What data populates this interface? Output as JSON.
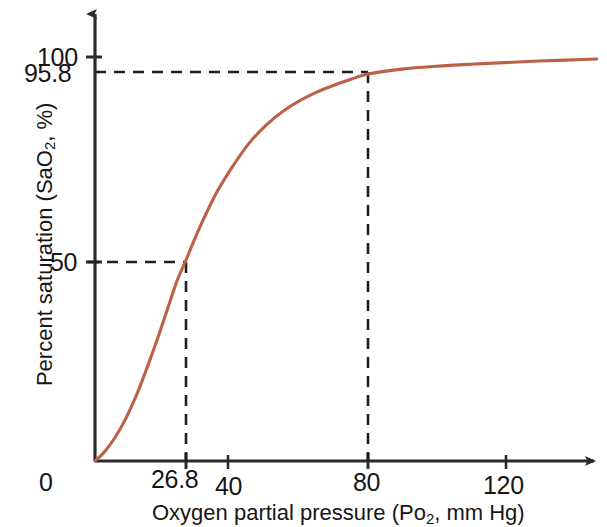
{
  "chart_data": {
    "type": "line",
    "title": "",
    "subtitle": "",
    "xlabel": "Oxygen partial pressure (Po2, mm Hg)",
    "ylabel": "Percent saturation (SaO2, %)",
    "xlabel_parts": {
      "pre": "Oxygen partial pressure (Po",
      "sub": "2",
      "post": ", mm Hg)"
    },
    "ylabel_parts": {
      "pre": "Percent saturation  (SaO",
      "sub": "2",
      "post": ", %)"
    },
    "xlim": [
      0,
      147
    ],
    "ylim": [
      0,
      105
    ],
    "grid": false,
    "legend": null,
    "x_ticks": [
      "0",
      "26.8",
      "40",
      "80",
      "120"
    ],
    "x_tick_values": [
      0,
      26.8,
      40,
      80,
      120
    ],
    "y_ticks": [
      "100",
      "95.8",
      "50"
    ],
    "y_tick_values": [
      100,
      95.8,
      50
    ],
    "series": [
      {
        "name": "Oxygen-hemoglobin dissociation curve",
        "color": "#bb6147",
        "x": [
          0,
          3,
          6,
          9,
          12,
          15,
          18,
          21,
          24,
          26.8,
          30,
          33,
          36,
          40,
          45,
          50,
          55,
          60,
          65,
          70,
          75,
          80,
          90,
          100,
          110,
          120,
          130,
          140,
          147
        ],
        "y": [
          0,
          2.5,
          6,
          10.5,
          16,
          22.5,
          29.5,
          37,
          44.5,
          50,
          56.5,
          62,
          67,
          72.5,
          78.5,
          83,
          86.5,
          89.2,
          91.3,
          93,
          94.5,
          95.8,
          97,
          97.7,
          98.2,
          98.6,
          99,
          99.3,
          99.5
        ]
      }
    ],
    "annotations": [
      {
        "name": "p50-guide",
        "x": 26.8,
        "y": 50,
        "style": "dashed",
        "note": "50% saturation at 26.8 mm Hg"
      },
      {
        "name": "arterial-guide",
        "x": 80,
        "y": 95.8,
        "style": "dashed",
        "note": "95.8% saturation at 80 mm Hg"
      }
    ],
    "colors": {
      "curve": "#bb6147",
      "axis": "#2b2b2b",
      "guide": "#1f1f1f",
      "background": "#ffffff"
    }
  }
}
